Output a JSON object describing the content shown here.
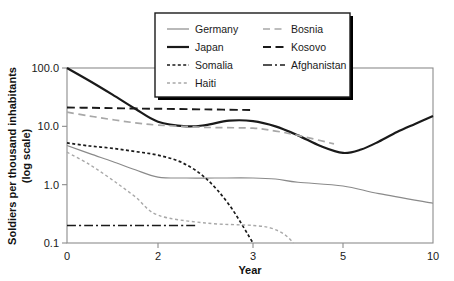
{
  "chart_data": {
    "type": "line",
    "title": "",
    "xlabel": "Year",
    "ylabel": "Soldiers per thousand inhabitants (log scale)",
    "ylabel_line1": "Soldiers per thousand inhabitants",
    "ylabel_line2": "(log scale)",
    "yscale": "log",
    "ylim": [
      0.1,
      100.0
    ],
    "ytick_labels": [
      "100.0",
      "10.0",
      "1.0",
      "0.1"
    ],
    "ytick_values": [
      100.0,
      10.0,
      1.0,
      0.1
    ],
    "xtick_labels": [
      "0",
      "2",
      "3",
      "5",
      "10"
    ],
    "xtick_values": [
      0,
      2,
      3,
      5,
      10
    ],
    "x_axis_note": "non-linear compressed axis",
    "grid": false,
    "legend_position": "top-center",
    "series": [
      {
        "name": "Germany",
        "style": "thin-solid",
        "color": "#8a8a8a",
        "x": [
          0,
          0.5,
          1,
          1.5,
          2,
          2.3,
          2.6,
          3,
          3.5,
          4,
          5,
          7,
          10
        ],
        "values": [
          4.7,
          3.4,
          2.5,
          1.8,
          1.35,
          1.3,
          1.3,
          1.3,
          1.25,
          1.1,
          0.95,
          0.7,
          0.48
        ]
      },
      {
        "name": "Japan",
        "style": "thick-solid",
        "color": "#1a1a1a",
        "x": [
          0,
          0.5,
          1,
          1.5,
          2,
          2.3,
          2.5,
          2.75,
          3,
          3.5,
          4,
          4.5,
          5,
          6,
          7,
          8,
          9,
          10
        ],
        "values": [
          100.0,
          60.0,
          35.0,
          20.0,
          12.0,
          10.0,
          10.5,
          12.5,
          12.3,
          10.0,
          7.0,
          4.6,
          3.5,
          4.0,
          5.5,
          8.0,
          11.0,
          15.0
        ]
      },
      {
        "name": "Somalia",
        "style": "dense-dash",
        "color": "#1a1a1a",
        "x": [
          0,
          0.5,
          1,
          1.5,
          2,
          2.25,
          2.5,
          2.75,
          3
        ],
        "values": [
          5.2,
          4.6,
          4.2,
          3.7,
          3.2,
          2.4,
          1.3,
          0.45,
          0.1
        ]
      },
      {
        "name": "Haiti",
        "style": "light-dash",
        "color": "#a8a8a8",
        "x": [
          0,
          0.5,
          1,
          1.5,
          2,
          2.5,
          3,
          3.4,
          3.7,
          3.9
        ],
        "values": [
          3.6,
          2.2,
          1.2,
          0.62,
          0.3,
          0.22,
          0.2,
          0.18,
          0.14,
          0.1
        ]
      },
      {
        "name": "Bosnia",
        "style": "light-long-dash",
        "color": "#a8a8a8",
        "x": [
          0,
          0.5,
          1,
          1.5,
          2,
          2.5,
          3,
          3.5,
          4,
          4.8
        ],
        "values": [
          17.5,
          15.0,
          13.0,
          11.5,
          10.5,
          9.6,
          9.3,
          8.3,
          7.0,
          5.0
        ]
      },
      {
        "name": "Kosovo",
        "style": "dark-long-dash",
        "color": "#1a1a1a",
        "x": [
          0,
          0.5,
          1,
          1.5,
          2,
          2.5,
          3
        ],
        "values": [
          21.0,
          20.8,
          20.5,
          20.2,
          20.0,
          19.5,
          19.0
        ]
      },
      {
        "name": "Afghanistan",
        "style": "dash-dot",
        "color": "#1a1a1a",
        "x": [
          0,
          0.5,
          1,
          1.5,
          2,
          2.4
        ],
        "values": [
          0.2,
          0.2,
          0.2,
          0.2,
          0.2,
          0.2
        ]
      }
    ]
  },
  "legend": {
    "entries": [
      {
        "label": "Germany"
      },
      {
        "label": "Bosnia"
      },
      {
        "label": "Japan"
      },
      {
        "label": "Kosovo"
      },
      {
        "label": "Somalia"
      },
      {
        "label": "Afghanistan"
      },
      {
        "label": "Haiti"
      }
    ]
  }
}
